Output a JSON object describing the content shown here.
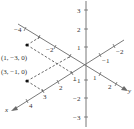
{
  "diagram": {
    "type": "3d-coordinate-axes",
    "axes": {
      "x": {
        "label": "x",
        "ticks": [
          "-2",
          "-1",
          "1",
          "2",
          "3",
          "4"
        ]
      },
      "y": {
        "label": "y",
        "ticks": [
          "-4",
          "-2",
          "1",
          "2"
        ]
      },
      "z": {
        "label": "",
        "ticks": [
          "3",
          "2",
          "1",
          "-1",
          "-2",
          "-3"
        ]
      }
    },
    "points": [
      {
        "label": "(1, −3, 0)",
        "coords": [
          1,
          -3,
          0
        ]
      },
      {
        "label": "(3, −1, 0)",
        "coords": [
          3,
          -1,
          0
        ]
      }
    ],
    "colors": {
      "axis": "#6a6a6a",
      "text": "#333333",
      "point": "#111111"
    }
  },
  "labels": {
    "z_3": "3",
    "z_2": "2",
    "z_1": "1",
    "z_m1": "−1",
    "z_m2": "−2",
    "z_m3": "−3",
    "y_m4": "−4",
    "y_m2": "−2",
    "y_1": "1",
    "y_2": "2",
    "y_axis": "y",
    "x_m2": "−2",
    "x_m1": "−1",
    "x_1": "1",
    "x_2": "2",
    "x_3": "3",
    "x_4": "4",
    "x_axis": "x",
    "point1": "(1, −3, 0)",
    "point2": "(3, −1, 0)"
  }
}
